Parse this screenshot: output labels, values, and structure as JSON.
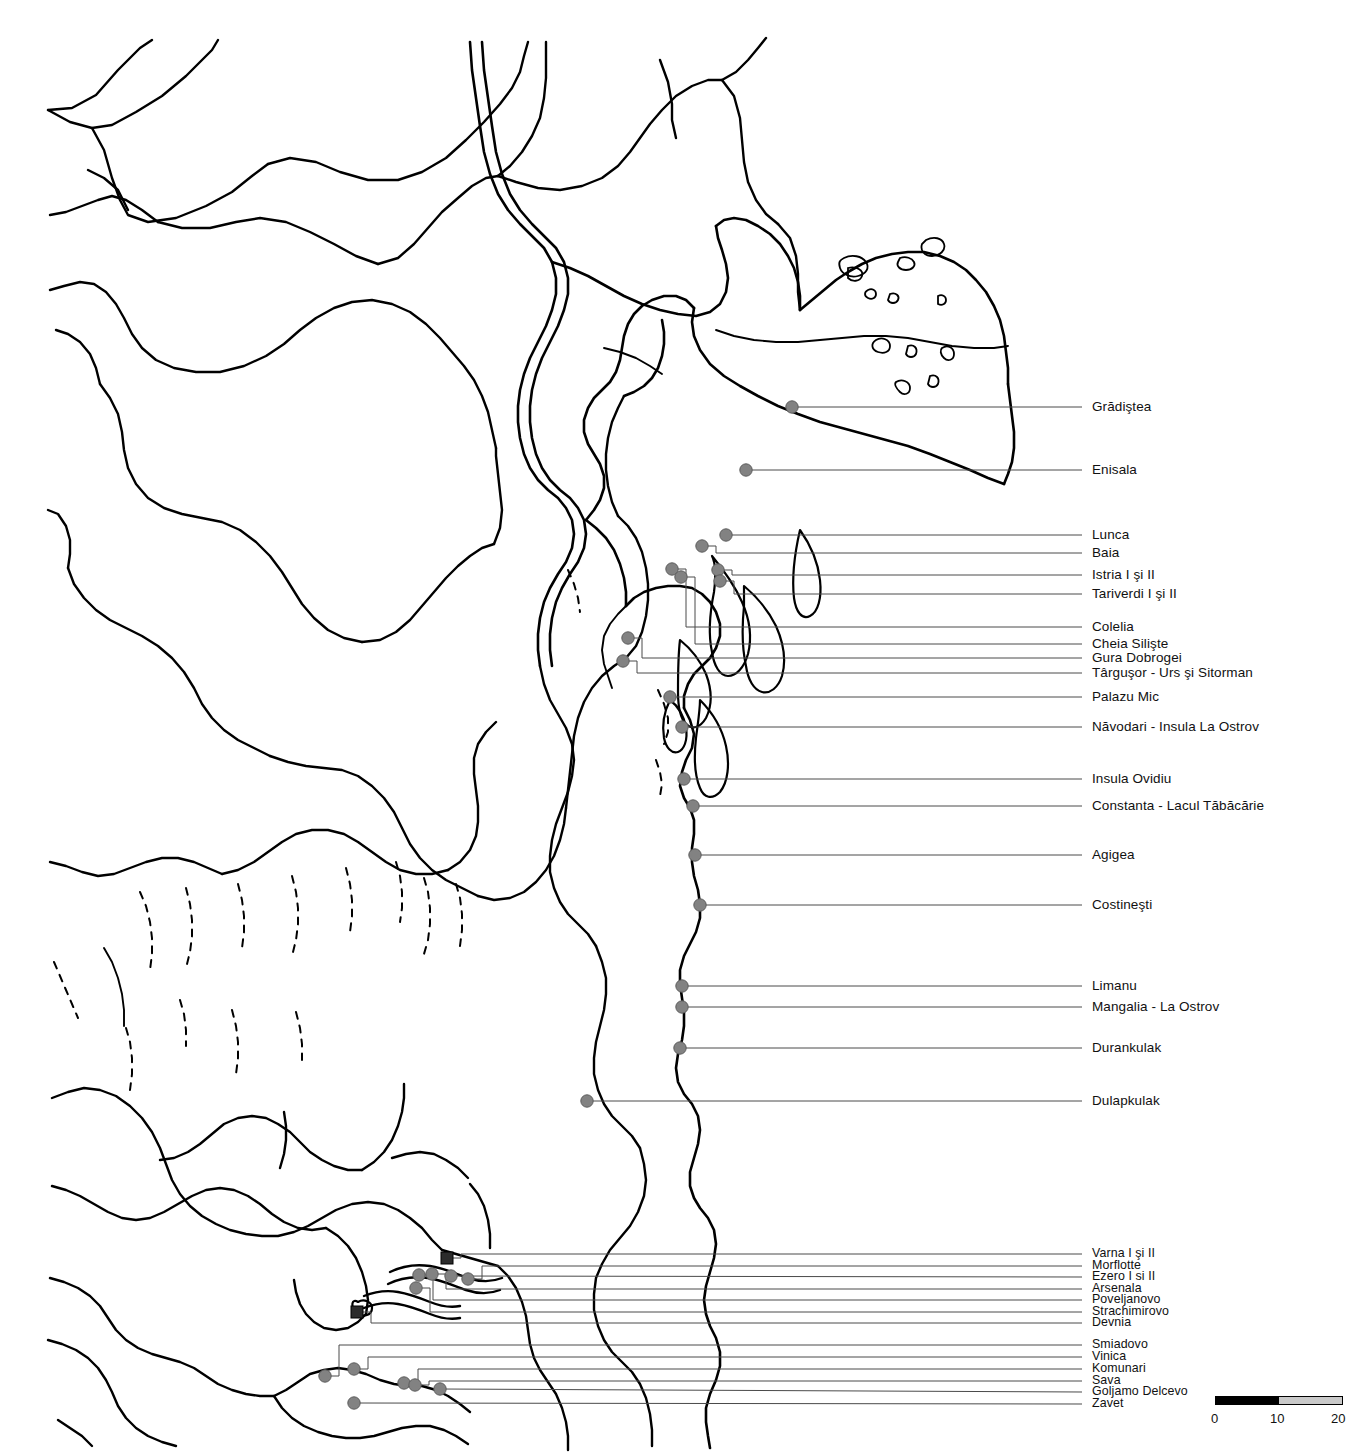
{
  "map": {
    "title": "Archaeological sites map of Dobrogea and the Varna region (Black Sea coast)",
    "background_color": "#ffffff",
    "line_color": "#000000",
    "site_marker_color": "#828282",
    "special_marker_color": "#2b2b2b",
    "leader_line_color": "#4a4a4a"
  },
  "scale": {
    "unit_ticks": [
      "0",
      "10",
      "20"
    ],
    "segment_black_label": "0-10",
    "segment_gray_label": "10-20"
  },
  "sites": [
    {
      "name": "Grădiştea",
      "marker": "circle",
      "mx": 792,
      "my": 407,
      "lx": 1092,
      "ly": 407
    },
    {
      "name": "Enisala",
      "marker": "circle",
      "mx": 746,
      "my": 470,
      "lx": 1092,
      "ly": 470
    },
    {
      "name": "Lunca",
      "marker": "circle",
      "mx": 726,
      "my": 535,
      "lx": 1092,
      "ly": 535
    },
    {
      "name": "Baia",
      "marker": "circle",
      "mx": 702,
      "my": 546,
      "lx": 1092,
      "ly": 553
    },
    {
      "name": "Istria I şi II",
      "marker": "circle",
      "mx": 718,
      "my": 570,
      "lx": 1092,
      "ly": 575
    },
    {
      "name": "Tariverdi I şi II",
      "marker": "circle",
      "mx": 720,
      "my": 581,
      "lx": 1092,
      "ly": 594
    },
    {
      "name": "Colelia",
      "marker": "circle",
      "mx": 672,
      "my": 569,
      "lx": 1092,
      "ly": 627
    },
    {
      "name": "Cheia Silişte",
      "marker": "circle",
      "mx": 681,
      "my": 577,
      "lx": 1092,
      "ly": 644
    },
    {
      "name": "Gura Dobrogei",
      "marker": "circle",
      "mx": 628,
      "my": 638,
      "lx": 1092,
      "ly": 658
    },
    {
      "name": "Târguşor - Urs şi Sitorman",
      "marker": "circle",
      "mx": 623,
      "my": 661,
      "lx": 1092,
      "ly": 673
    },
    {
      "name": "Palazu Mic",
      "marker": "circle",
      "mx": 670,
      "my": 697,
      "lx": 1092,
      "ly": 697
    },
    {
      "name": "Năvodari - Insula La Ostrov",
      "marker": "circle",
      "mx": 682,
      "my": 727,
      "lx": 1092,
      "ly": 727
    },
    {
      "name": "Insula Ovidiu",
      "marker": "circle",
      "mx": 684,
      "my": 779,
      "lx": 1092,
      "ly": 779
    },
    {
      "name": "Constanta - Lacul Tăbăcărie",
      "marker": "circle",
      "mx": 693,
      "my": 806,
      "lx": 1092,
      "ly": 806
    },
    {
      "name": "Agigea",
      "marker": "circle",
      "mx": 695,
      "my": 855,
      "lx": 1092,
      "ly": 855
    },
    {
      "name": "Costineşti",
      "marker": "circle",
      "mx": 700,
      "my": 905,
      "lx": 1092,
      "ly": 905
    },
    {
      "name": "Limanu",
      "marker": "circle",
      "mx": 682,
      "my": 986,
      "lx": 1092,
      "ly": 986
    },
    {
      "name": "Mangalia - La Ostrov",
      "marker": "circle",
      "mx": 682,
      "my": 1007,
      "lx": 1092,
      "ly": 1007
    },
    {
      "name": "Durankulak",
      "marker": "circle",
      "mx": 680,
      "my": 1048,
      "lx": 1092,
      "ly": 1048
    },
    {
      "name": "Dulapkulak",
      "marker": "circle",
      "mx": 587,
      "my": 1101,
      "lx": 1092,
      "ly": 1101
    },
    {
      "name": "Varna I şi II",
      "marker": "square",
      "mx": 447,
      "my": 1258,
      "lx": 1092,
      "ly": 1254
    },
    {
      "name": "Morflotte",
      "marker": "circle",
      "mx": 468,
      "my": 1279,
      "lx": 1092,
      "ly": 1266
    },
    {
      "name": "Ezero I si II",
      "marker": "circle",
      "mx": 451,
      "my": 1276,
      "lx": 1092,
      "ly": 1277
    },
    {
      "name": "Arsenala",
      "marker": "circle",
      "mx": 432,
      "my": 1274,
      "lx": 1092,
      "ly": 1289
    },
    {
      "name": "Poveljanovo",
      "marker": "circle",
      "mx": 419,
      "my": 1275,
      "lx": 1092,
      "ly": 1300
    },
    {
      "name": "Strachimirovo",
      "marker": "circle",
      "mx": 416,
      "my": 1288,
      "lx": 1092,
      "ly": 1312
    },
    {
      "name": "Devnia",
      "marker": "square",
      "mx": 357,
      "my": 1312,
      "lx": 1092,
      "ly": 1323
    },
    {
      "name": "Smiadovo",
      "marker": "circle",
      "mx": 325,
      "my": 1376,
      "lx": 1092,
      "ly": 1345
    },
    {
      "name": "Vinica",
      "marker": "circle",
      "mx": 354,
      "my": 1369,
      "lx": 1092,
      "ly": 1357
    },
    {
      "name": "Komunari",
      "marker": "circle",
      "mx": 404,
      "my": 1383,
      "lx": 1092,
      "ly": 1369
    },
    {
      "name": "Sava",
      "marker": "circle",
      "mx": 415,
      "my": 1385,
      "lx": 1092,
      "ly": 1381
    },
    {
      "name": "Goljamo Delcevo",
      "marker": "circle",
      "mx": 440,
      "my": 1389,
      "lx": 1092,
      "ly": 1392
    },
    {
      "name": "Zavet",
      "marker": "circle",
      "mx": 354,
      "my": 1403,
      "lx": 1092,
      "ly": 1404
    }
  ]
}
